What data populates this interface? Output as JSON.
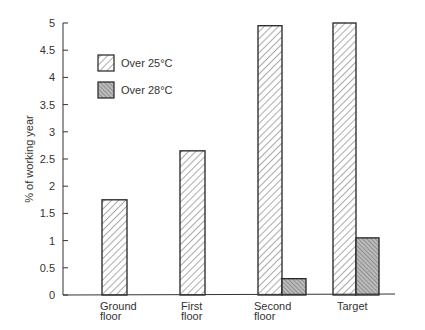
{
  "chart_data": {
    "type": "bar",
    "title": "",
    "xlabel": "",
    "ylabel": "% of working year",
    "ylim": [
      0,
      5
    ],
    "yticks": [
      0,
      0.5,
      1,
      1.5,
      2,
      2.5,
      3,
      3.5,
      4,
      4.5,
      5
    ],
    "ytick_labels": [
      "0",
      "0.5",
      "1",
      "1.5",
      "2",
      "2.5",
      "3",
      "3.5",
      "4",
      "4.5",
      "5"
    ],
    "grid": false,
    "legend_position": "upper left",
    "categories": [
      {
        "line1": "Ground",
        "line2": "floor"
      },
      {
        "line1": "First",
        "line2": "floor"
      },
      {
        "line1": "Second",
        "line2": "floor"
      },
      {
        "line1": "Target",
        "line2": ""
      }
    ],
    "series": [
      {
        "name": "Over 25°C",
        "pattern": "light-diagonal-hatch",
        "values": [
          1.75,
          2.65,
          4.95,
          5.0
        ]
      },
      {
        "name": "Over 28°C",
        "pattern": "dense-cross-hatch",
        "values": [
          null,
          null,
          0.3,
          1.05
        ]
      }
    ]
  }
}
